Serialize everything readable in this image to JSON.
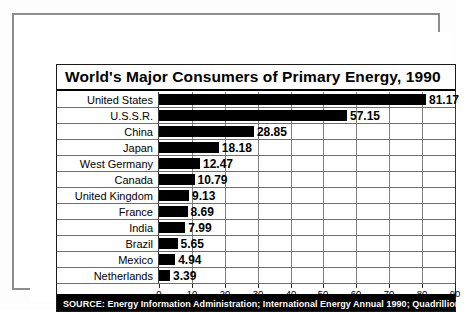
{
  "chart_data": {
    "type": "bar",
    "orientation": "horizontal",
    "title": "World's Major Consumers of Primary Energy, 1990",
    "xlabel": "",
    "ylabel": "",
    "xlim": [
      0,
      90
    ],
    "xticks": [
      "0",
      "10",
      "20",
      "30",
      "40",
      "50",
      "60",
      "70",
      "80",
      "90"
    ],
    "grid": true,
    "legend": false,
    "bar_color": "#000000",
    "categories": [
      "United States",
      "U.S.S.R.",
      "China",
      "Japan",
      "West Germany",
      "Canada",
      "United Kingdom",
      "France",
      "India",
      "Brazil",
      "Mexico",
      "Netherlands"
    ],
    "values": [
      81.17,
      57.15,
      28.85,
      18.18,
      12.47,
      10.79,
      9.13,
      8.69,
      7.99,
      5.65,
      4.94,
      3.39
    ],
    "value_labels": [
      "81.17",
      "57.15",
      "28.85",
      "18.18",
      "12.47",
      "10.79",
      "9.13",
      "8.69",
      "7.99",
      "5.65",
      "4.94",
      "3.39"
    ],
    "units": "Quadrillion Btu"
  },
  "source": {
    "prefix": "SOURCE:",
    "text": "Energy Information Administration; International Energy Annual 1990; Quadrillion (10",
    "exponent": "15",
    "suffix": ")Btu",
    "full": "SOURCE: Energy Information Administration; International Energy Annual 1990; Quadrillion (10^15)Btu"
  }
}
